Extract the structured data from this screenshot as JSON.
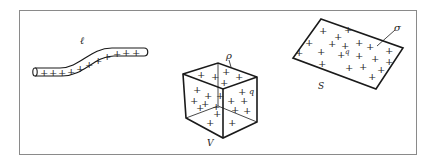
{
  "figure": {
    "frame_color": "#777777",
    "stroke_color": "#1a1a1a",
    "line_charge": {
      "label": "ℓ",
      "charges": [
        "+",
        "+",
        "+",
        "+",
        "+",
        "+",
        "+",
        "+",
        "+",
        "+",
        "+"
      ]
    },
    "volume_charge": {
      "density_label": "ρ",
      "charge_label": "q",
      "volume_label": "V"
    },
    "surface_charge": {
      "density_label": "σ",
      "charge_label": "q",
      "surface_label": "S"
    }
  }
}
